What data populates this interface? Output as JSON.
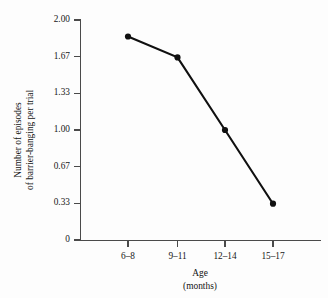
{
  "chart_data": {
    "type": "line",
    "title": "",
    "subtitle": "",
    "categories": [
      "6–8",
      "9–11",
      "12–14",
      "15–17"
    ],
    "values": [
      1.85,
      1.66,
      1.0,
      0.33
    ],
    "series": [
      {
        "name": "barrier-banging episodes",
        "values": [
          1.85,
          1.66,
          1.0,
          0.33
        ]
      }
    ],
    "xlabel_line1": "Age",
    "xlabel_line2": "(months)",
    "ylabel_line1": "Number of episodes",
    "ylabel_line2": "of barrier-banging per trial",
    "ytick_labels": [
      "2.00",
      "1.67",
      "1.33",
      "1.00",
      "0.67",
      "0.33",
      "0"
    ],
    "ytick_values": [
      2.0,
      1.67,
      1.33,
      1.0,
      0.67,
      0.33,
      0
    ],
    "ylim": [
      0,
      2.0
    ],
    "grid": false,
    "legend": false,
    "legend_position": "none",
    "marker": "filled-circle",
    "line_color": "#101010",
    "marker_color": "#101010",
    "axis_color": "#4a4a4a",
    "background_color": "#fdfdfd"
  }
}
